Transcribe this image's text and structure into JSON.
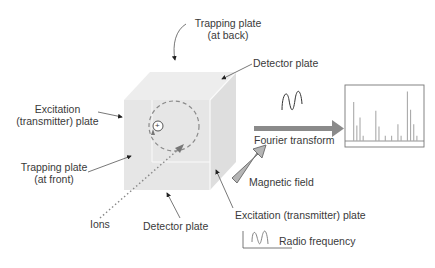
{
  "labels": {
    "trapping_back_line1": "Trapping plate",
    "trapping_back_line2": "(at back)",
    "detector_top": "Detector plate",
    "excitation_left_line1": "Excitation",
    "excitation_left_line2": "(transmitter) plate",
    "trapping_front_line1": "Trapping plate",
    "trapping_front_line2": "(at front)",
    "ions": "Ions",
    "detector_bottom": "Detector plate",
    "excitation_right": "Excitation (transmitter) plate",
    "fourier_transform": "Fourier transform",
    "magnetic_field": "Magnetic field",
    "radio_frequency": "Radio frequency",
    "ion_symbol": "+"
  },
  "colors": {
    "cube_front": "#e6e6e6",
    "cube_top": "#ededed",
    "cube_side": "#dedede",
    "arrow_gray": "#8a8a8a",
    "magnetic_arrow_fill": "#b5b5b5",
    "text": "#3a3a3a"
  },
  "spectrum": {
    "peaks": [
      0.75,
      0.3,
      0.45,
      0.1,
      0.58,
      0.28,
      0.1,
      0.1,
      0.32,
      0.1,
      0.95,
      0.6,
      0.32,
      0.1
    ],
    "positions": [
      0.11,
      0.15,
      0.19,
      0.23,
      0.39,
      0.43,
      0.51,
      0.59,
      0.67,
      0.71,
      0.79,
      0.83,
      0.87,
      0.91
    ]
  }
}
